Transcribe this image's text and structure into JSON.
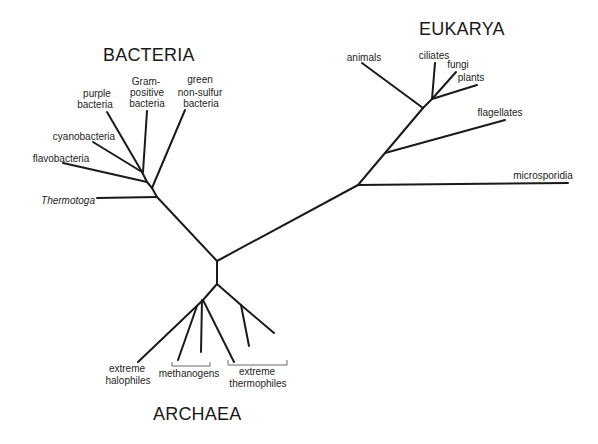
{
  "domains": {
    "bacteria": {
      "label": "BACTERIA",
      "groups": {
        "purple": [
          "purple",
          "bacteria"
        ],
        "gram_positive": [
          "Gram-",
          "positive",
          "bacteria"
        ],
        "green_nonsulfur": [
          "green",
          "non-sulfur",
          "bacteria"
        ],
        "cyanobacteria": "cyanobacteria",
        "flavobacteria": "flavobacteria",
        "thermotoga": "Thermotoga"
      }
    },
    "eukarya": {
      "label": "EUKARYA",
      "groups": {
        "animals": "animals",
        "ciliates": "ciliates",
        "fungi": "fungi",
        "plants": "plants",
        "flagellates": "flagellates",
        "microsporidia": "microsporidia"
      }
    },
    "archaea": {
      "label": "ARCHAEA",
      "groups": {
        "halophiles": [
          "extreme",
          "halophiles"
        ],
        "methanogens": "methanogens",
        "thermophiles": [
          "extreme",
          "thermophiles"
        ]
      }
    }
  },
  "colors": {
    "line": "#1a1a1a",
    "text": "#1e1e1e",
    "background": "#ffffff"
  }
}
